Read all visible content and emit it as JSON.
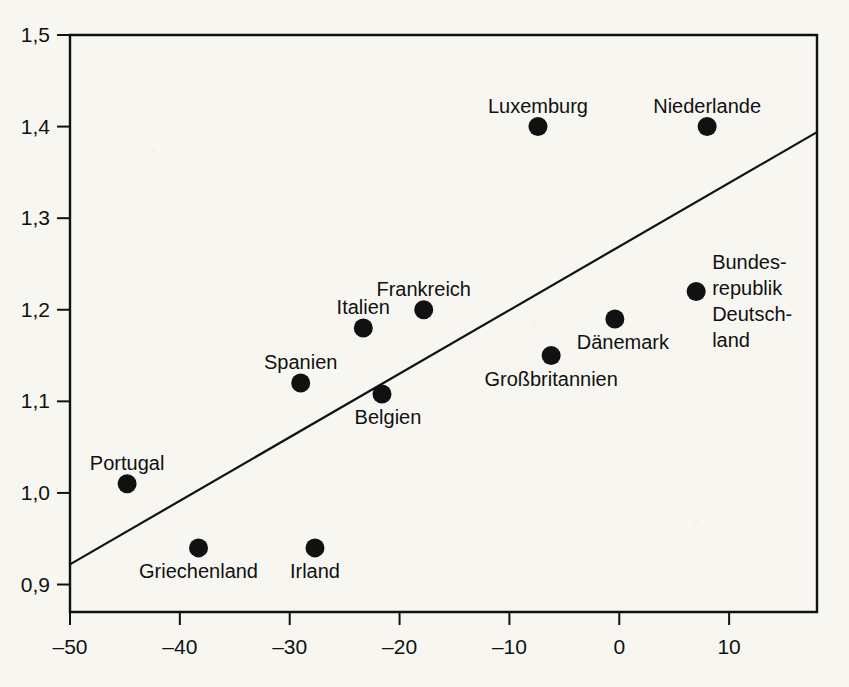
{
  "chart_data": {
    "type": "scatter",
    "title": "",
    "xlabel": "",
    "ylabel": "",
    "xlim": [
      -50,
      18
    ],
    "ylim": [
      0.87,
      1.5
    ],
    "grid": false,
    "legend": "none",
    "xticks": [
      -50,
      -40,
      -30,
      -20,
      -10,
      0,
      10
    ],
    "xticklabels": [
      "-50",
      "-40",
      "-30",
      "-20",
      "-10",
      "0",
      "10"
    ],
    "yticks": [
      0.9,
      1.0,
      1.1,
      1.2,
      1.3,
      1.4,
      1.5
    ],
    "yticklabels": [
      "0,9",
      "1,0",
      "1,1",
      "1,2",
      "1,3",
      "1,4",
      "1,5"
    ],
    "points": [
      {
        "label": "Portugal",
        "x": -44.8,
        "y": 1.01,
        "label_pos": "above",
        "dx": 0,
        "dy": -14
      },
      {
        "label": "Griechenland",
        "x": -38.3,
        "y": 0.94,
        "label_pos": "below",
        "dx": 0,
        "dy": 30
      },
      {
        "label": "Spanien",
        "x": -29.0,
        "y": 1.12,
        "label_pos": "above",
        "dx": 0,
        "dy": -14
      },
      {
        "label": "Irland",
        "x": -27.7,
        "y": 0.94,
        "label_pos": "below",
        "dx": 0,
        "dy": 30
      },
      {
        "label": "Italien",
        "x": -23.3,
        "y": 1.18,
        "label_pos": "above",
        "dx": 0,
        "dy": -14
      },
      {
        "label": "Belgien",
        "x": -21.6,
        "y": 1.108,
        "label_pos": "below",
        "dx": 6,
        "dy": 30
      },
      {
        "label": "Frankreich",
        "x": -17.8,
        "y": 1.2,
        "label_pos": "above",
        "dx": 0,
        "dy": -14
      },
      {
        "label": "Luxemburg",
        "x": -7.4,
        "y": 1.4,
        "label_pos": "above",
        "dx": 0,
        "dy": -14
      },
      {
        "label": "Großbritannien",
        "x": -6.2,
        "y": 1.15,
        "label_pos": "below",
        "dx": 0,
        "dy": 30
      },
      {
        "label": "Dänemark",
        "x": -0.4,
        "y": 1.19,
        "label_pos": "below",
        "dx": 8,
        "dy": 30
      },
      {
        "label": "Niederlande",
        "x": 8.0,
        "y": 1.4,
        "label_pos": "above",
        "dx": 0,
        "dy": -14
      },
      {
        "label": "Bundes-republik Deutsch-land",
        "x": 7.0,
        "y": 1.22,
        "label_pos": "right-multiline",
        "dx": 16,
        "dy": -22,
        "lines": [
          "Bundes-",
          "republik",
          "Deutsch-",
          "land"
        ]
      }
    ],
    "trendline": {
      "name": "Regressionsgerade",
      "x0": -50,
      "y0": 0.922,
      "x1": 18,
      "y1": 1.394
    }
  }
}
